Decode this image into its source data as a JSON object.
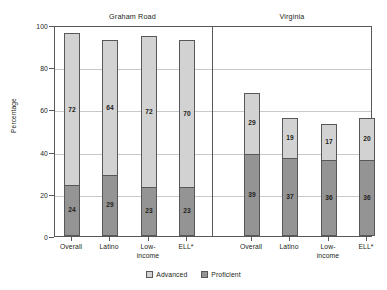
{
  "title_cropped": "Student Achievement",
  "axis": {
    "y_title": "Percentage",
    "y_ticks": [
      "0",
      "20",
      "40",
      "60",
      "80",
      "100"
    ]
  },
  "groups": [
    {
      "name": "Graham Road"
    },
    {
      "name": "Virginia"
    }
  ],
  "legend": {
    "items": [
      {
        "label": "Advanced",
        "color": "#d2d2d2"
      },
      {
        "label": "Proficient",
        "color": "#949494"
      }
    ]
  },
  "chart_data": {
    "type": "bar",
    "title": "Student Achievement",
    "xlabel": "",
    "ylabel": "Percentage",
    "ylim": [
      0,
      100
    ],
    "yticks": [
      0,
      20,
      40,
      60,
      80,
      100
    ],
    "grid": true,
    "stacked": true,
    "legend_position": "bottom",
    "group_labels": [
      "Graham Road",
      "Virginia"
    ],
    "categories": [
      "Overall",
      "Latino",
      "Low-income",
      "ELL*"
    ],
    "series": [
      {
        "name": "Proficient",
        "color": "#949494",
        "values_by_group": {
          "Graham Road": [
            24,
            29,
            23,
            23
          ],
          "Virginia": [
            39,
            37,
            36,
            36
          ]
        }
      },
      {
        "name": "Advanced",
        "color": "#d2d2d2",
        "values_by_group": {
          "Graham Road": [
            72,
            64,
            72,
            70
          ],
          "Virginia": [
            29,
            19,
            17,
            20
          ]
        }
      }
    ],
    "totals_by_group": {
      "Graham Road": [
        96,
        93,
        95,
        93
      ],
      "Virginia": [
        68,
        56,
        53,
        56
      ]
    }
  },
  "bars": [
    {
      "group": "Graham Road",
      "category": "Overall",
      "cat_line1": "Overall",
      "cat_line2": "",
      "proficient": 24,
      "advanced": 72
    },
    {
      "group": "Graham Road",
      "category": "Latino",
      "cat_line1": "Latino",
      "cat_line2": "",
      "proficient": 29,
      "advanced": 64
    },
    {
      "group": "Graham Road",
      "category": "Low-income",
      "cat_line1": "Low-",
      "cat_line2": "income",
      "proficient": 23,
      "advanced": 72
    },
    {
      "group": "Graham Road",
      "category": "ELL*",
      "cat_line1": "ELL*",
      "cat_line2": "",
      "proficient": 23,
      "advanced": 70
    },
    {
      "group": "Virginia",
      "category": "Overall",
      "cat_line1": "Overall",
      "cat_line2": "",
      "proficient": 39,
      "advanced": 29
    },
    {
      "group": "Virginia",
      "category": "Latino",
      "cat_line1": "Latino",
      "cat_line2": "",
      "proficient": 37,
      "advanced": 19
    },
    {
      "group": "Virginia",
      "category": "Low-income",
      "cat_line1": "Low-",
      "cat_line2": "income",
      "proficient": 36,
      "advanced": 17
    },
    {
      "group": "Virginia",
      "category": "ELL*",
      "cat_line1": "ELL*",
      "cat_line2": "",
      "proficient": 36,
      "advanced": 20
    }
  ]
}
